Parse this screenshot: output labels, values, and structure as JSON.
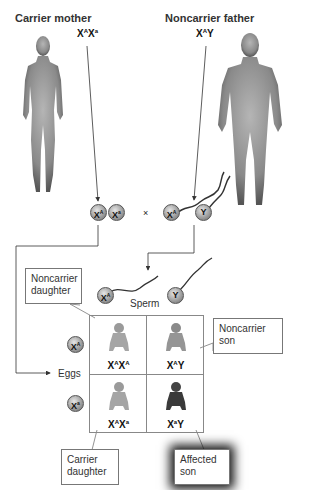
{
  "parents": {
    "mother": {
      "title": "Carrier mother",
      "genotype_base": "X",
      "genotype_parts": [
        {
          "base": "X",
          "sup": "A"
        },
        {
          "base": "X",
          "sup": "a"
        }
      ]
    },
    "father": {
      "title": "Noncarrier father",
      "genotype_parts": [
        {
          "base": "X",
          "sup": "A"
        },
        {
          "base": "Y",
          "sup": ""
        }
      ]
    }
  },
  "cross_symbol": "×",
  "gametes": {
    "mother": [
      {
        "base": "X",
        "sup": "A"
      },
      {
        "base": "X",
        "sup": "a"
      }
    ],
    "father": [
      {
        "base": "X",
        "sup": "A"
      },
      {
        "base": "Y",
        "sup": ""
      }
    ]
  },
  "punnett": {
    "sperm_label": "Sperm",
    "eggs_label": "Eggs",
    "sperm": [
      {
        "base": "X",
        "sup": "A"
      },
      {
        "base": "Y",
        "sup": ""
      }
    ],
    "eggs": [
      {
        "base": "X",
        "sup": "A"
      },
      {
        "base": "X",
        "sup": "a"
      }
    ],
    "cells": [
      {
        "genotype": "XᴬXᴬ",
        "parts": [
          {
            "base": "X",
            "sup": "A"
          },
          {
            "base": "X",
            "sup": "A"
          }
        ],
        "shade": "light"
      },
      {
        "genotype": "XᴬY",
        "parts": [
          {
            "base": "X",
            "sup": "A"
          },
          {
            "base": "Y",
            "sup": ""
          }
        ],
        "shade": "medium"
      },
      {
        "genotype": "XᴬXᵃ",
        "parts": [
          {
            "base": "X",
            "sup": "A"
          },
          {
            "base": "X",
            "sup": "a"
          }
        ],
        "shade": "light"
      },
      {
        "genotype": "XᵃY",
        "parts": [
          {
            "base": "X",
            "sup": "a"
          },
          {
            "base": "Y",
            "sup": ""
          }
        ],
        "shade": "dark"
      }
    ]
  },
  "callouts": {
    "noncarrier_daughter": [
      "Noncarrier",
      "daughter"
    ],
    "noncarrier_son": [
      "Noncarrier",
      "son"
    ],
    "carrier_daughter": [
      "Carrier",
      "daughter"
    ],
    "affected_son": [
      "Affected",
      "son"
    ]
  },
  "colors": {
    "line": "#333333",
    "box_border": "#777777",
    "figure": "#8a8a8a",
    "affected": "#3a3a3a"
  }
}
